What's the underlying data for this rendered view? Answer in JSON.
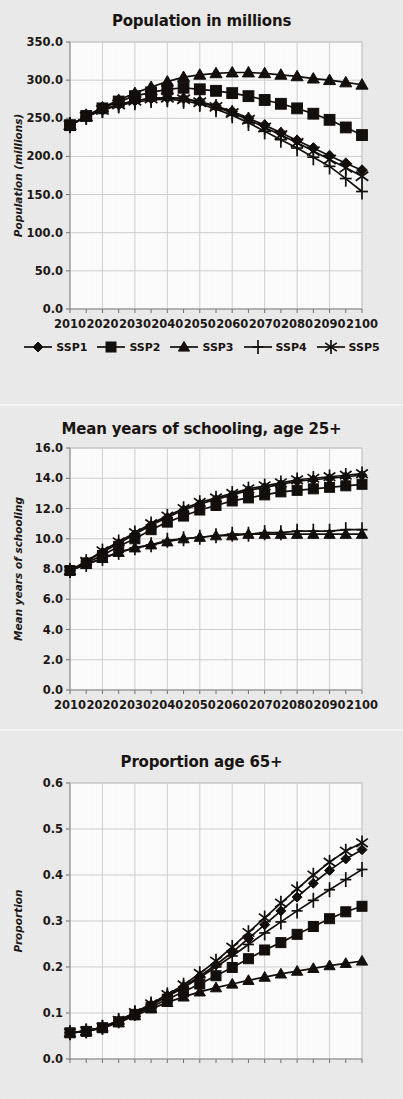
{
  "legend": {
    "entries": [
      {
        "label": "SSP1",
        "marker": "diamond-marker-icon"
      },
      {
        "label": "SSP2",
        "marker": "square-marker-icon"
      },
      {
        "label": "SSP3",
        "marker": "triangle-marker-icon"
      },
      {
        "label": "SSP4",
        "marker": "plus-marker-icon"
      },
      {
        "label": "SSP5",
        "marker": "asterisk-marker-icon"
      }
    ]
  },
  "chart_data": [
    {
      "id": "population",
      "type": "line",
      "title": "Population in millions",
      "xlabel": "",
      "ylabel": "Population (millions)",
      "grid": true,
      "legend_position": "bottom",
      "xlim": [
        2010,
        2100
      ],
      "ylim": [
        0.0,
        350.0
      ],
      "yticks": [
        "0.0",
        "50.0",
        "100.0",
        "150.0",
        "200.0",
        "250.0",
        "300.0",
        "350.0"
      ],
      "ytick_values": [
        0,
        50,
        100,
        150,
        200,
        250,
        300,
        350
      ],
      "xticks": [
        "2010",
        "2020",
        "2030",
        "2040",
        "2050",
        "2060",
        "2070",
        "2080",
        "2090",
        "2100"
      ],
      "x": [
        2010,
        2015,
        2020,
        2025,
        2030,
        2035,
        2040,
        2045,
        2050,
        2055,
        2060,
        2065,
        2070,
        2075,
        2080,
        2085,
        2090,
        2095,
        2100
      ],
      "series": [
        {
          "name": "SSP1",
          "marker": "diamond",
          "values": [
            241,
            252,
            261,
            268,
            273,
            276,
            277,
            276,
            272,
            266,
            259,
            250,
            241,
            231,
            221,
            211,
            201,
            191,
            182
          ]
        },
        {
          "name": "SSP2",
          "marker": "square",
          "values": [
            241,
            253,
            263,
            272,
            279,
            284,
            288,
            290,
            288,
            286,
            283,
            279,
            274,
            269,
            263,
            256,
            248,
            238,
            228
          ]
        },
        {
          "name": "SSP3",
          "marker": "triangle",
          "values": [
            241,
            253,
            264,
            274,
            283,
            291,
            298,
            304,
            307,
            309,
            310,
            310,
            309,
            307,
            305,
            302,
            300,
            297,
            294
          ]
        },
        {
          "name": "SSP4",
          "marker": "plus",
          "values": [
            241,
            252,
            261,
            267,
            271,
            274,
            275,
            273,
            269,
            262,
            254,
            244,
            233,
            222,
            211,
            199,
            187,
            171,
            154
          ]
        },
        {
          "name": "SSP5",
          "marker": "asterisk",
          "values": [
            241,
            252,
            261,
            268,
            273,
            276,
            277,
            275,
            271,
            265,
            257,
            248,
            238,
            228,
            218,
            207,
            196,
            185,
            174
          ]
        }
      ]
    },
    {
      "id": "schooling",
      "type": "line",
      "title": "Mean years of schooling, age 25+",
      "xlabel": "",
      "ylabel": "Mean years of schooling",
      "grid": true,
      "legend_position": "none",
      "xlim": [
        2010,
        2100
      ],
      "ylim": [
        0.0,
        16.0
      ],
      "yticks": [
        "0.0",
        "2.0",
        "4.0",
        "6.0",
        "8.0",
        "10.0",
        "12.0",
        "14.0",
        "16.0"
      ],
      "ytick_values": [
        0,
        2,
        4,
        6,
        8,
        10,
        12,
        14,
        16
      ],
      "xticks": [
        "2010",
        "2020",
        "2030",
        "2040",
        "2050",
        "2060",
        "2070",
        "2080",
        "2090",
        "2100"
      ],
      "x": [
        2010,
        2015,
        2020,
        2025,
        2030,
        2035,
        2040,
        2045,
        2050,
        2055,
        2060,
        2065,
        2070,
        2075,
        2080,
        2085,
        2090,
        2095,
        2100
      ],
      "series": [
        {
          "name": "SSP1",
          "marker": "diamond",
          "values": [
            7.9,
            8.5,
            9.1,
            9.7,
            10.3,
            10.9,
            11.4,
            11.9,
            12.3,
            12.6,
            12.9,
            13.2,
            13.4,
            13.6,
            13.8,
            13.9,
            14.0,
            14.1,
            14.2
          ]
        },
        {
          "name": "SSP2",
          "marker": "square",
          "values": [
            7.9,
            8.4,
            8.9,
            9.5,
            10.0,
            10.6,
            11.1,
            11.5,
            11.9,
            12.2,
            12.5,
            12.7,
            12.9,
            13.1,
            13.2,
            13.3,
            13.4,
            13.5,
            13.6
          ]
        },
        {
          "name": "SSP3",
          "marker": "triangle",
          "values": [
            7.9,
            8.3,
            8.7,
            9.1,
            9.4,
            9.6,
            9.8,
            10.0,
            10.1,
            10.2,
            10.2,
            10.3,
            10.3,
            10.3,
            10.3,
            10.3,
            10.3,
            10.3,
            10.3
          ]
        },
        {
          "name": "SSP4",
          "marker": "plus",
          "values": [
            7.9,
            8.3,
            8.7,
            9.1,
            9.4,
            9.6,
            9.9,
            10.0,
            10.1,
            10.2,
            10.3,
            10.3,
            10.4,
            10.4,
            10.5,
            10.5,
            10.5,
            10.6,
            10.6
          ]
        },
        {
          "name": "SSP5",
          "marker": "asterisk",
          "values": [
            7.9,
            8.5,
            9.2,
            9.8,
            10.4,
            11.0,
            11.5,
            12.0,
            12.4,
            12.7,
            13.0,
            13.3,
            13.5,
            13.7,
            13.9,
            14.0,
            14.1,
            14.2,
            14.3
          ]
        }
      ]
    },
    {
      "id": "proportion65",
      "type": "line",
      "title": "Proportion age 65+",
      "xlabel": "",
      "ylabel": "Proportion",
      "grid": true,
      "legend_position": "none",
      "xlim": [
        2010,
        2100
      ],
      "ylim": [
        0.0,
        0.6
      ],
      "yticks": [
        "0.0",
        "0.1",
        "0.2",
        "0.3",
        "0.4",
        "0.5",
        "0.6"
      ],
      "ytick_values": [
        0,
        0.1,
        0.2,
        0.3,
        0.4,
        0.5,
        0.6
      ],
      "xticks": [
        "2010",
        "2020",
        "2030",
        "2040",
        "2050",
        "2060",
        "2070",
        "2080",
        "2090",
        "2100"
      ],
      "x": [
        2010,
        2015,
        2020,
        2025,
        2030,
        2035,
        2040,
        2045,
        2050,
        2055,
        2060,
        2065,
        2070,
        2075,
        2080,
        2085,
        2090,
        2095,
        2100
      ],
      "series": [
        {
          "name": "SSP1",
          "marker": "diamond",
          "values": [
            0.057,
            0.061,
            0.069,
            0.083,
            0.1,
            0.118,
            0.138,
            0.157,
            0.18,
            0.205,
            0.232,
            0.262,
            0.292,
            0.322,
            0.352,
            0.382,
            0.41,
            0.435,
            0.455
          ]
        },
        {
          "name": "SSP2",
          "marker": "square",
          "values": [
            0.057,
            0.06,
            0.068,
            0.081,
            0.097,
            0.113,
            0.13,
            0.146,
            0.163,
            0.181,
            0.199,
            0.218,
            0.237,
            0.253,
            0.271,
            0.288,
            0.305,
            0.32,
            0.332
          ]
        },
        {
          "name": "SSP3",
          "marker": "triangle",
          "values": [
            0.057,
            0.06,
            0.067,
            0.079,
            0.094,
            0.109,
            0.123,
            0.135,
            0.146,
            0.155,
            0.163,
            0.171,
            0.178,
            0.185,
            0.191,
            0.197,
            0.203,
            0.208,
            0.213
          ]
        },
        {
          "name": "SSP4",
          "marker": "plus",
          "values": [
            0.057,
            0.061,
            0.069,
            0.083,
            0.099,
            0.117,
            0.136,
            0.155,
            0.177,
            0.2,
            0.224,
            0.249,
            0.274,
            0.298,
            0.322,
            0.345,
            0.368,
            0.39,
            0.412
          ]
        },
        {
          "name": "SSP5",
          "marker": "asterisk",
          "values": [
            0.057,
            0.061,
            0.069,
            0.084,
            0.101,
            0.12,
            0.14,
            0.161,
            0.186,
            0.213,
            0.243,
            0.275,
            0.307,
            0.339,
            0.37,
            0.4,
            0.428,
            0.452,
            0.47
          ]
        }
      ]
    }
  ]
}
